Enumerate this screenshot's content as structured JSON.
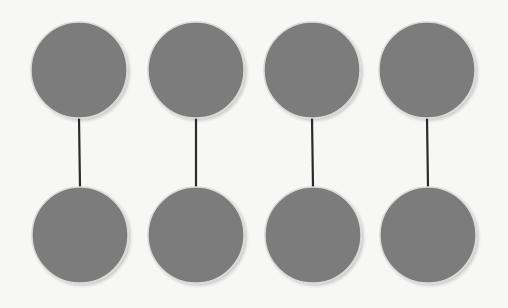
{
  "diagram": {
    "background": "#f7f7f6",
    "node_fill": "#7b7b7b",
    "node_halo": "#d9d9d9",
    "edge_color": "#2b2b2b",
    "node_radius": 48,
    "pairs": [
      {
        "top": {
          "cx": 79,
          "cy": 70
        },
        "bottom": {
          "cx": 80,
          "cy": 235
        }
      },
      {
        "top": {
          "cx": 196,
          "cy": 70
        },
        "bottom": {
          "cx": 196,
          "cy": 235
        }
      },
      {
        "top": {
          "cx": 312,
          "cy": 70
        },
        "bottom": {
          "cx": 313,
          "cy": 235
        }
      },
      {
        "top": {
          "cx": 427,
          "cy": 70
        },
        "bottom": {
          "cx": 428,
          "cy": 235
        }
      }
    ]
  }
}
